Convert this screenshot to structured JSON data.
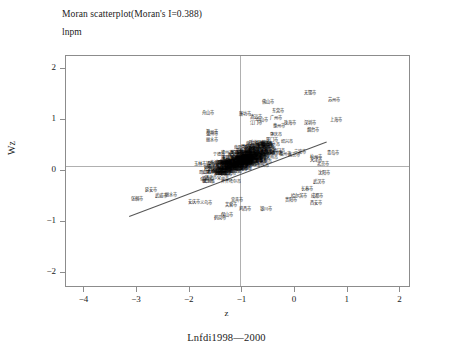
{
  "title": "Moran scatterplot(Moran's I=0.388)",
  "y_axis_top_label": "lnpm",
  "axis_title_y": "Wz",
  "axis_title_x": "z",
  "caption": "Lnfdi1998—2000",
  "chart_data": {
    "type": "scatter",
    "title": "Moran scatterplot(Moran's I=0.388)",
    "subtitle": "lnpm",
    "xlabel": "z",
    "ylabel": "Wz",
    "caption": "Lnfdi1998—2000",
    "morans_i": 0.388,
    "xlim": [
      -4.35,
      2.2
    ],
    "ylim": [
      -2.3,
      2.25
    ],
    "xticks": [
      -4,
      -3,
      -2,
      -1,
      0,
      1,
      2
    ],
    "yticks": [
      -2,
      -1,
      0,
      1,
      2
    ],
    "xtick_labels": [
      "−4",
      "−3",
      "−2",
      "−1",
      "0",
      "1",
      "2"
    ],
    "ytick_labels": [
      "−2",
      "−1",
      "0",
      "1",
      "2"
    ],
    "grid": false,
    "legend": "none",
    "reference_lines": {
      "horizontal_y": 0.09,
      "vertical_x": -1.05
    },
    "regression_line": {
      "x0": -3.15,
      "y0": -0.88,
      "x1": 0.6,
      "y1": 0.58,
      "slope": 0.389
    },
    "point_label_style": "chinese-city-names",
    "points": [
      {
        "label": "无锡市",
        "x": 0.28,
        "y": 1.52
      },
      {
        "label": "苏州市",
        "x": 0.73,
        "y": 1.38
      },
      {
        "label": "佛山市",
        "x": -0.52,
        "y": 1.34
      },
      {
        "label": "舟山市",
        "x": -1.66,
        "y": 1.14
      },
      {
        "label": "廉坊市",
        "x": -0.96,
        "y": 1.12
      },
      {
        "label": "东莞市",
        "x": -0.33,
        "y": 1.18
      },
      {
        "label": "广州市",
        "x": -0.36,
        "y": 1.04
      },
      {
        "label": "清远市",
        "x": -0.74,
        "y": 1.06
      },
      {
        "label": "上海市",
        "x": 0.78,
        "y": 1.0
      },
      {
        "label": "深圳市",
        "x": 0.28,
        "y": 0.94
      },
      {
        "label": "烟台市",
        "x": 0.33,
        "y": 0.8
      },
      {
        "label": "江门市",
        "x": -0.74,
        "y": 0.94
      },
      {
        "label": "惠州市",
        "x": -0.3,
        "y": 0.88
      },
      {
        "label": "珠海市",
        "x": -0.1,
        "y": 0.93
      },
      {
        "label": "中山市",
        "x": -0.62,
        "y": 1.0
      },
      {
        "label": "厦门市",
        "x": -0.43,
        "y": 0.6
      },
      {
        "label": "温州市",
        "x": -1.58,
        "y": 0.72
      },
      {
        "label": "丽水市",
        "x": -1.58,
        "y": 0.6
      },
      {
        "label": "滁州市",
        "x": -1.58,
        "y": 0.75
      },
      {
        "label": "宁波市",
        "x": 0.1,
        "y": 0.36
      },
      {
        "label": "青岛市",
        "x": 0.72,
        "y": 0.34
      },
      {
        "label": "杭州市",
        "x": 0.4,
        "y": 0.26
      },
      {
        "label": "天津市",
        "x": 0.4,
        "y": 0.22
      },
      {
        "label": "北京市",
        "x": 0.52,
        "y": 0.14
      },
      {
        "label": "南京市",
        "x": -0.03,
        "y": 0.3
      },
      {
        "label": "福州市",
        "x": -0.2,
        "y": 0.32
      },
      {
        "label": "泉州市",
        "x": -0.56,
        "y": 0.4
      },
      {
        "label": "玉林市",
        "x": -1.8,
        "y": 0.14
      },
      {
        "label": "沈阳市",
        "x": 0.55,
        "y": -0.04
      },
      {
        "label": "武汉市",
        "x": 0.45,
        "y": -0.22
      },
      {
        "label": "长春市",
        "x": 0.22,
        "y": -0.36
      },
      {
        "label": "哈尔滨市",
        "x": 0.08,
        "y": -0.5
      },
      {
        "label": "成都市",
        "x": 0.42,
        "y": -0.5
      },
      {
        "label": "西安市",
        "x": 0.4,
        "y": -0.64
      },
      {
        "label": "贵阳市",
        "x": -0.08,
        "y": -0.58
      },
      {
        "label": "银川市",
        "x": -0.55,
        "y": -0.76
      },
      {
        "label": "鸡西市",
        "x": -0.95,
        "y": -0.76
      },
      {
        "label": "鹤岗市",
        "x": -1.42,
        "y": -0.92
      },
      {
        "label": "保山市",
        "x": -1.3,
        "y": -0.86
      },
      {
        "label": "延安市",
        "x": -2.74,
        "y": -0.38
      },
      {
        "label": "武威市",
        "x": -2.55,
        "y": -0.5
      },
      {
        "label": "丽水市",
        "x": -2.35,
        "y": -0.48
      },
      {
        "label": "张掴市",
        "x": -3.0,
        "y": -0.56
      },
      {
        "label": "安庆市",
        "x": -1.92,
        "y": -0.62
      },
      {
        "label": "义乌市",
        "x": -1.7,
        "y": -0.64
      },
      {
        "label": "宜宾市",
        "x": -1.1,
        "y": -0.58
      },
      {
        "label": "芙蓉市",
        "x": -1.22,
        "y": -0.68
      }
    ],
    "dense_cluster": {
      "description": "Large overlapping mass of Chinese city name labels centered near (-1.0, 0.2)",
      "x_center": -1.0,
      "y_center": 0.2,
      "approx_count": 250
    }
  }
}
